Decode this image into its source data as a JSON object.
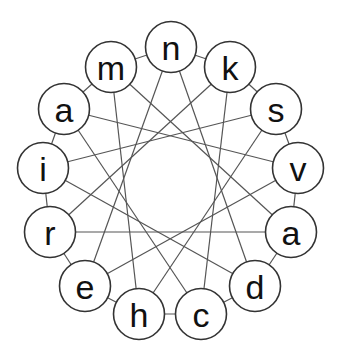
{
  "diagram": {
    "type": "star-polygon-ring",
    "star_step": 5,
    "node_radius": 25.5,
    "colors": {
      "line": "#555555",
      "node_stroke": "#333333",
      "node_fill": "#ffffff",
      "text": "#111111"
    },
    "nodes": [
      {
        "label": "n",
        "x": 171,
        "y": 47
      },
      {
        "label": "k",
        "x": 230,
        "y": 67
      },
      {
        "label": "s",
        "x": 276,
        "y": 109
      },
      {
        "label": "v",
        "x": 298,
        "y": 168
      },
      {
        "label": "a",
        "x": 291,
        "y": 232
      },
      {
        "label": "d",
        "x": 255,
        "y": 286
      },
      {
        "label": "c",
        "x": 201,
        "y": 314
      },
      {
        "label": "h",
        "x": 139,
        "y": 314
      },
      {
        "label": "e",
        "x": 85,
        "y": 286
      },
      {
        "label": "r",
        "x": 50,
        "y": 232
      },
      {
        "label": "i",
        "x": 43,
        "y": 168
      },
      {
        "label": "a",
        "x": 64,
        "y": 109
      },
      {
        "label": "m",
        "x": 111,
        "y": 67
      }
    ]
  }
}
